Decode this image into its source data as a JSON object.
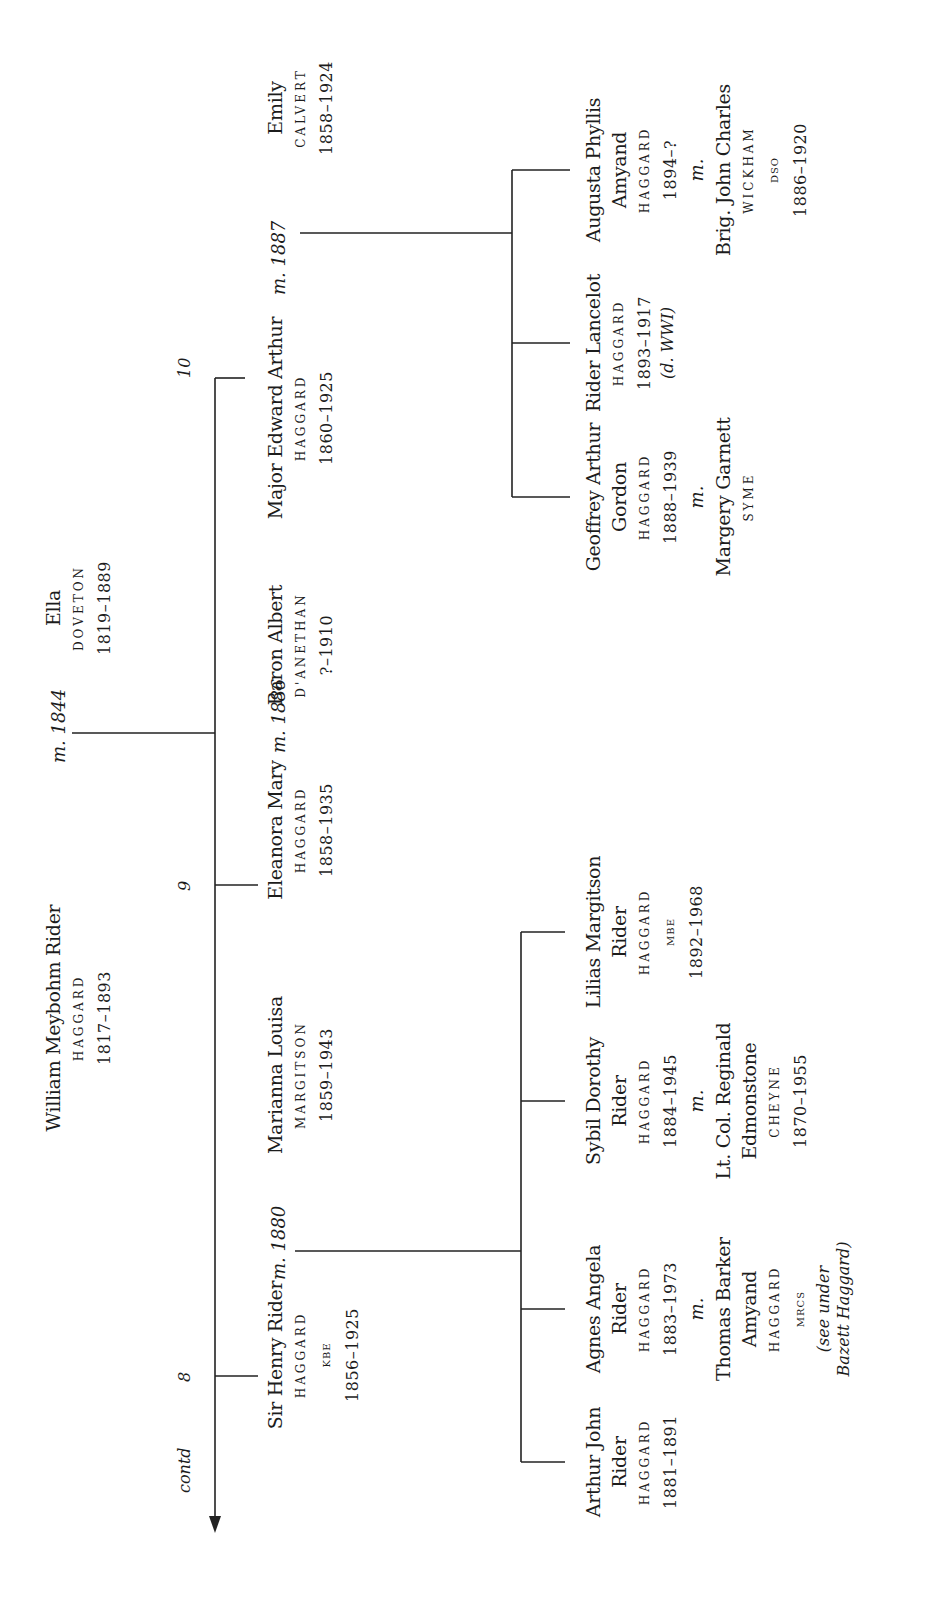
{
  "diagram": {
    "type": "family-tree",
    "orientation": "rotated-90-ccw",
    "continuation_label": "contd",
    "line_color": "#222222",
    "text_color": "#1c1c1c"
  },
  "root_couple": {
    "husband": {
      "given": "William Meybohm Rider",
      "surname": "HAGGARD",
      "dates": "1817–1893"
    },
    "marriage": "m. 1844",
    "wife": {
      "given": "Ella",
      "surname": "DOVETON",
      "dates": "1819–1889"
    }
  },
  "children": [
    {
      "index": "10",
      "person": {
        "given": "Major Edward Arthur",
        "surname": "HAGGARD",
        "dates": "1860–1925"
      },
      "marriage": "m. 1887",
      "spouse": {
        "given": "Emily",
        "surname": "CALVERT",
        "dates": "1858–1924"
      },
      "children": [
        {
          "given_lines": [
            "Geoffrey Arthur",
            "Gordon"
          ],
          "surname": "HAGGARD",
          "dates": "1888–1939",
          "marriage": "m.",
          "spouse": {
            "given": "Margery Garnett",
            "surname": "SYME"
          }
        },
        {
          "given_lines": [
            "Rider Lancelot"
          ],
          "surname": "HAGGARD",
          "dates": "1893–1917",
          "note": "(d. WWI)"
        },
        {
          "given_lines": [
            "Augusta Phyllis",
            "Amyand"
          ],
          "surname": "HAGGARD",
          "dates": "1894–?",
          "marriage": "m.",
          "spouse": {
            "given": "Brig. John Charles",
            "surname": "WICKHAM",
            "honour": "DSO",
            "dates": "1886–1920"
          }
        }
      ]
    },
    {
      "index": "",
      "person": {
        "given": "Eleanora Mary",
        "surname": "HAGGARD",
        "dates": "1858–1935"
      },
      "marriage": "m. 1886",
      "spouse": {
        "given": "Baron Albert",
        "surname": "D'ANETHAN",
        "dates": "?–1910"
      }
    },
    {
      "index": "9",
      "label_only": true
    },
    {
      "index": "8",
      "person": {
        "given": "Sir Henry Rider",
        "surname": "HAGGARD",
        "honour": "KBE",
        "dates": "1856–1925"
      },
      "marriage": "m. 1880",
      "spouse": {
        "given": "Marianna Louisa",
        "surname": "MARGITSON",
        "dates": "1859–1943"
      },
      "children": [
        {
          "given_lines": [
            "Arthur John",
            "Rider"
          ],
          "surname": "HAGGARD",
          "dates": "1881–1891"
        },
        {
          "given_lines": [
            "Agnes Angela",
            "Rider"
          ],
          "surname": "HAGGARD",
          "dates": "1883–1973",
          "marriage": "m.",
          "spouse": {
            "given_lines": [
              "Thomas Barker",
              "Amyand"
            ],
            "surname": "HAGGARD",
            "honour": "MRCS",
            "note_lines": [
              "(see under",
              "Bazett Haggard)"
            ]
          }
        },
        {
          "given_lines": [
            "Sybil Dorothy",
            "Rider"
          ],
          "surname": "HAGGARD",
          "dates": "1884–1945",
          "marriage": "m.",
          "spouse": {
            "given_lines": [
              "Lt. Col. Reginald",
              "Edmonstone"
            ],
            "surname": "CHEYNE",
            "dates": "1870–1955"
          }
        },
        {
          "given_lines": [
            "Lilias Margitson",
            "Rider"
          ],
          "surname": "HAGGARD",
          "honour": "MBE",
          "dates": "1892–1968"
        }
      ]
    }
  ],
  "labels": {
    "branch_numbers": [
      "8",
      "9",
      "10"
    ],
    "marriages": [
      "m. 1844",
      "m. 1886",
      "m. 1887",
      "m. 1880"
    ]
  }
}
